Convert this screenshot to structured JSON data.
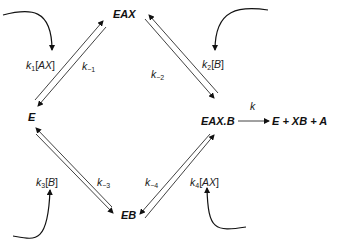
{
  "nodes": {
    "eax": "EAX",
    "e": "E",
    "eaxb": "EAX.B",
    "eb": "EB",
    "products": "E + XB + A"
  },
  "rates": {
    "k1": {
      "k": "k",
      "sub": "1",
      "species": "AX"
    },
    "km1": {
      "k": "k",
      "sub": "−1"
    },
    "km2": {
      "k": "k",
      "sub": "−2"
    },
    "k2": {
      "k": "k",
      "sub": "2",
      "species": "B"
    },
    "k3": {
      "k": "k",
      "sub": "3",
      "species": "B"
    },
    "km3": {
      "k": "k",
      "sub": "−3"
    },
    "km4": {
      "k": "k",
      "sub": "−4"
    },
    "k4": {
      "k": "k",
      "sub": "4",
      "species": "AX"
    },
    "k": "k"
  },
  "colors": {
    "line": "#111111",
    "background": "#ffffff"
  }
}
